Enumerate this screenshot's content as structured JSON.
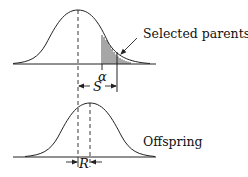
{
  "diagram": {
    "title": "",
    "labels": {
      "selected_parents": "Selected parents",
      "offspring": "Offspring",
      "alpha": "α",
      "selection_differential": "S",
      "response": "R"
    },
    "panels": [
      {
        "name": "parents-distribution",
        "mean_x": 78,
        "baseline_y": 64,
        "peak_y": 10,
        "truncation_point_x": 102,
        "selected_mean_x": 117,
        "shaded_region": "right tail beyond truncation point (hatched)"
      },
      {
        "name": "offspring-distribution",
        "mean_x": 90,
        "baseline_y": 157,
        "peak_y": 103,
        "parent_mean_reference_x": 78
      }
    ],
    "colors": {
      "line": "#222222",
      "background": "#ffffff"
    }
  }
}
